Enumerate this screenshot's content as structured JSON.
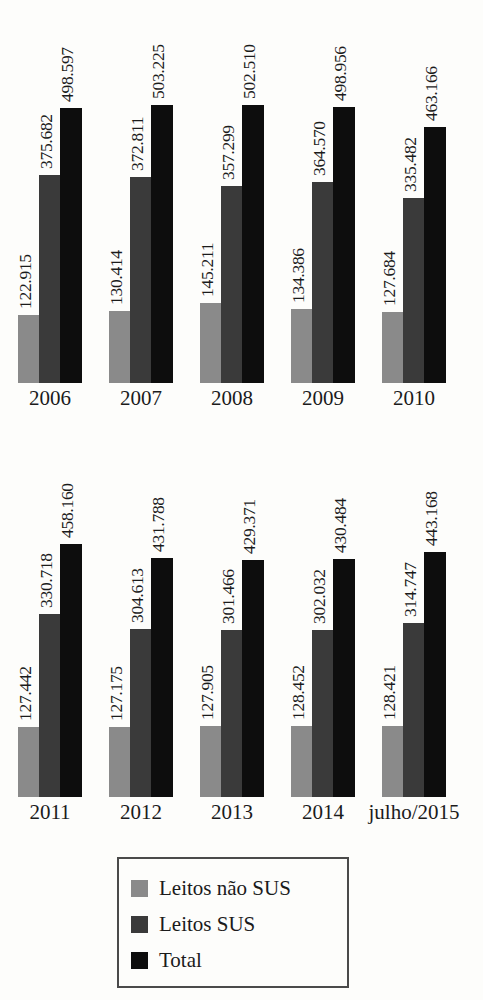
{
  "chart_data": {
    "type": "bar",
    "title": "",
    "subtitle": "",
    "xlabel": "",
    "ylabel": "",
    "grid": false,
    "legend_position": "bottom",
    "ylim": [
      0,
      503225
    ],
    "categories": [
      "2006",
      "2007",
      "2008",
      "2009",
      "2010",
      "2011",
      "2012",
      "2013",
      "2014",
      "julho/2015"
    ],
    "series": [
      {
        "name": "Leitos não SUS",
        "color": "#8a8a8a",
        "values": [
          122915,
          130414,
          145211,
          134386,
          127684,
          127442,
          127175,
          127905,
          128452,
          128421
        ],
        "labels": [
          "122.915",
          "130.414",
          "145.211",
          "134.386",
          "127.684",
          "127.442",
          "127.175",
          "127.905",
          "128.452",
          "128.421"
        ]
      },
      {
        "name": "Leitos SUS",
        "color": "#3a3a3a",
        "values": [
          375682,
          372811,
          357299,
          364570,
          335482,
          330718,
          304613,
          301466,
          302032,
          314747
        ],
        "labels": [
          "375.682",
          "372.811",
          "357.299",
          "364.570",
          "335.482",
          "330.718",
          "304.613",
          "301.466",
          "302.032",
          "314.747"
        ]
      },
      {
        "name": "Total",
        "color": "#0d0d0d",
        "values": [
          498597,
          503225,
          502510,
          498956,
          463166,
          458160,
          431788,
          429371,
          430484,
          443168
        ],
        "labels": [
          "498.597",
          "503.225",
          "502.510",
          "498.956",
          "463.166",
          "458.160",
          "431.788",
          "429.371",
          "430.484",
          "443.168"
        ]
      }
    ],
    "rows": [
      {
        "start": 0,
        "count": 5
      },
      {
        "start": 5,
        "count": 5
      }
    ]
  },
  "legend": {
    "items": [
      {
        "label": "Leitos não SUS",
        "color": "#8a8a8a"
      },
      {
        "label": "Leitos SUS",
        "color": "#3a3a3a"
      },
      {
        "label": "Total",
        "color": "#0d0d0d"
      }
    ]
  },
  "layout": {
    "background": "#fdfdfb",
    "text_color": "#1b1b1b",
    "legend_border": "#4a4a4a"
  }
}
